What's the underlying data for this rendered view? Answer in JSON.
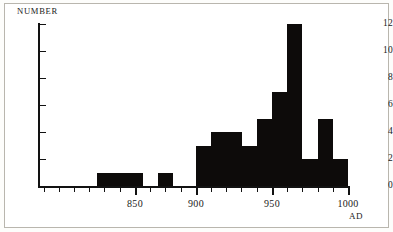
{
  "figure": {
    "background_color": "#ffffff",
    "frame_color": "#b9b6ae",
    "bar_color": "#0d0b0a",
    "axis_color": "#121212"
  },
  "axes": {
    "y_title": "NUMBER",
    "x_title": "AD",
    "y_ticks": [
      "0",
      "2",
      "4",
      "6",
      "8",
      "10",
      "12"
    ],
    "x_ticks": [
      "850",
      "900",
      "950",
      "1000"
    ]
  },
  "chart_data": {
    "type": "bar",
    "title": "",
    "subtitle": "",
    "xlabel": "AD",
    "ylabel": "NUMBER",
    "xlim": [
      820,
      1000
    ],
    "ylim": [
      0,
      12
    ],
    "grid": false,
    "legend": false,
    "bin_width": 10,
    "x_tick_labels": [
      "850",
      "900",
      "950",
      "1000"
    ],
    "x_tick_values": [
      850,
      900,
      950,
      1000
    ],
    "y_tick_labels": [
      "0",
      "2",
      "4",
      "6",
      "8",
      "10",
      "12"
    ],
    "y_tick_values": [
      0,
      2,
      4,
      6,
      8,
      10,
      12
    ],
    "minor_tick_interval": 5,
    "categories": [
      "835-845",
      "845-855",
      "855-865",
      "875-885",
      "900-910",
      "910-920",
      "920-930",
      "930-940",
      "940-950",
      "950-960",
      "960-970",
      "970-980",
      "980-990",
      "990-1000"
    ],
    "bin_starts": [
      835,
      845,
      855,
      875,
      900,
      910,
      920,
      930,
      940,
      950,
      960,
      970,
      980,
      990
    ],
    "values": [
      1,
      1,
      1,
      1,
      3,
      4,
      4,
      3,
      5,
      7,
      12,
      2,
      5,
      2
    ],
    "series": [
      {
        "name": "count",
        "values": [
          1,
          1,
          1,
          1,
          3,
          4,
          4,
          3,
          5,
          7,
          12,
          2,
          5,
          2
        ]
      }
    ],
    "max_value": 12,
    "total_count": 41
  }
}
